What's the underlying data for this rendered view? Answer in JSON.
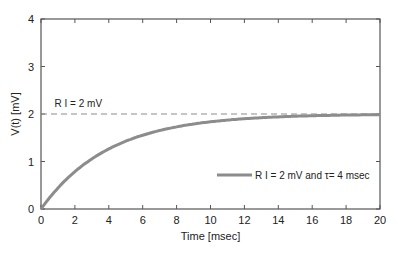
{
  "chart_data": {
    "type": "line",
    "title": "",
    "xlabel": "Time [msec]",
    "ylabel": "V(t) [mV]",
    "xlim": [
      0,
      20
    ],
    "ylim": [
      0,
      4
    ],
    "x_ticks": [
      0,
      2,
      4,
      6,
      8,
      10,
      12,
      14,
      16,
      18,
      20
    ],
    "y_ticks": [
      0,
      1,
      2,
      3,
      4
    ],
    "grid": false,
    "legend_position": "lower right",
    "series": [
      {
        "name": "R I = 2 mV  and  τ= 4 msec",
        "style": "solid",
        "color": "#8c8c8c",
        "formula": "V(t) = 2 * (1 - exp(-t/4))",
        "x": [
          0,
          1,
          2,
          3,
          4,
          5,
          6,
          7,
          8,
          9,
          10,
          11,
          12,
          13,
          14,
          15,
          16,
          17,
          18,
          19,
          20
        ],
        "values": [
          0,
          0.44,
          0.79,
          1.06,
          1.26,
          1.43,
          1.55,
          1.65,
          1.73,
          1.79,
          1.84,
          1.87,
          1.9,
          1.92,
          1.94,
          1.95,
          1.96,
          1.97,
          1.98,
          1.98,
          1.99
        ]
      },
      {
        "name": "R I = 2 mV",
        "style": "dashed",
        "color": "#8c8c8c",
        "x": [
          0,
          20
        ],
        "values": [
          2,
          2
        ]
      }
    ],
    "annotations": [
      {
        "text": "R I = 2 mV",
        "x": 0.8,
        "y": 2.15
      }
    ]
  }
}
